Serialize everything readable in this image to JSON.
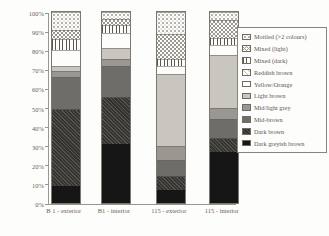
{
  "chart_data": {
    "type": "bar",
    "stacked": true,
    "title": "",
    "xlabel": "",
    "ylabel": "",
    "ylim": [
      0,
      100
    ],
    "grid": false,
    "legend_position": "right",
    "yticks": [
      "0%",
      "10%",
      "20%",
      "30%",
      "40%",
      "50%",
      "60%",
      "70%",
      "80%",
      "90%",
      "100%"
    ],
    "categories": [
      "B 1 - exterior",
      "B1 - interior",
      "115 - exterior",
      "115 - interior"
    ],
    "series_bottom_to_top": [
      {
        "name": "Dark greyish brown",
        "color": "#161616",
        "pattern": "solid",
        "values": [
          9,
          31,
          7,
          26.5
        ]
      },
      {
        "name": "Dark brown",
        "color": "#403e3b",
        "pattern": "diag-dark",
        "values": [
          40,
          24.5,
          7,
          7.5
        ]
      },
      {
        "name": "Mid-brown",
        "color": "#6f6d69",
        "pattern": "solid",
        "values": [
          17,
          16,
          8.5,
          10
        ]
      },
      {
        "name": "Mid/light grey",
        "color": "#9a9792",
        "pattern": "solid",
        "values": [
          3,
          4,
          7.5,
          6
        ]
      },
      {
        "name": "Light brown",
        "color": "#c9c6c0",
        "pattern": "solid",
        "values": [
          3,
          5.5,
          37.5,
          27.5
        ]
      },
      {
        "name": "Yellow/Orange",
        "color": "#fdfdfb",
        "pattern": "solid",
        "values": [
          8,
          8,
          4,
          5
        ]
      },
      {
        "name": "Reddish brown",
        "color": "#fdfdfb",
        "pattern": "diag-faint",
        "values": [
          0,
          0,
          0,
          0
        ]
      },
      {
        "name": "Mixed (dark)",
        "color": "#fdfdfb",
        "pattern": "vlines",
        "values": [
          6,
          4,
          4,
          4
        ]
      },
      {
        "name": "Mixed (light)",
        "color": "#fdfdfb",
        "pattern": "crosshatch",
        "values": [
          4.5,
          3.5,
          13,
          9.5
        ]
      },
      {
        "name": "Mottled (>2 colours)",
        "color": "#fdfdfb",
        "pattern": "dots",
        "values": [
          9.5,
          3.5,
          11.5,
          4
        ]
      }
    ],
    "legend_labels_top_to_bottom": [
      "Mottled (>2 colours)",
      "Mixed (light)",
      "Mixed (dark)",
      "Reddish brown",
      "Yellow/Orange",
      "Light brown",
      "Mid/light grey",
      "Mid-brown",
      "Dark brown",
      "Dark greyish brown"
    ],
    "layout_hints": {
      "bar_lefts_px": [
        2,
        52,
        107,
        160
      ],
      "bar_width_px": 27.5,
      "axis_color": "#9a968e",
      "paper_color": "#fdfdfb"
    }
  }
}
